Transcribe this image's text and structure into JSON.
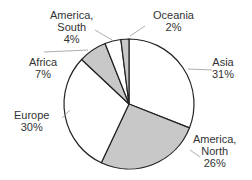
{
  "chart_data": {
    "type": "pie",
    "title": "",
    "categories": [
      "Asia",
      "America, North",
      "Europe",
      "Africa",
      "America, South",
      "Oceania"
    ],
    "values": [
      31,
      26,
      30,
      7,
      4,
      2
    ],
    "colors": [
      "#ffffff",
      "#c8c8c8",
      "#ffffff",
      "#c8c8c8",
      "#ffffff",
      "#c8c8c8"
    ],
    "labels": [
      {
        "name": "Asia",
        "pct": "31%"
      },
      {
        "name": "America, North",
        "pct": "26%"
      },
      {
        "name": "Europe",
        "pct": "30%"
      },
      {
        "name": "Africa",
        "pct": "7%"
      },
      {
        "name": "America, South",
        "pct": "4%"
      },
      {
        "name": "Oceania",
        "pct": "2%"
      }
    ]
  },
  "labels": {
    "asia": [
      "Asia",
      "31%"
    ],
    "na": [
      "America,",
      "North",
      "26%"
    ],
    "europe": [
      "Europe",
      "30%"
    ],
    "africa": [
      "Africa",
      "7%"
    ],
    "sa": [
      "America,",
      "South",
      "4%"
    ],
    "oceania": [
      "Oceania",
      "2%"
    ]
  }
}
